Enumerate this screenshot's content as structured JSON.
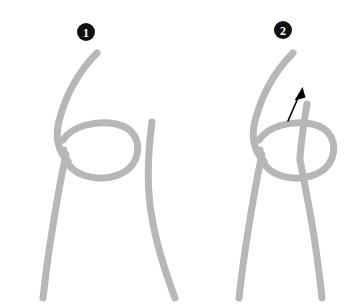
{
  "canvas": {
    "width": 353,
    "height": 305,
    "background_color": "#ffffff"
  },
  "style": {
    "rope_color": "#b7b7b7",
    "rope_width": 7,
    "badge_fill": "#111111",
    "badge_text_color": "#ffffff",
    "badge_radius": 9,
    "arrow_color": "#000000",
    "arrow_width": 1.6
  },
  "diagram": {
    "type": "two-step-knot-sequence"
  },
  "panels": [
    {
      "id": "panel-1",
      "badge": {
        "label": "1",
        "glyph": "❶",
        "cx": 86,
        "cy": 32
      },
      "description": "Rope forms an overhand loop beside a separate standing strand",
      "strands": [
        {
          "name": "working-strand-with-loop",
          "path": "M 97 53 C 78 72 64 96 57 124 C 51 147 62 166 83 172 C 107 178 130 166 131 148 C 132 131 113 122 95 128 C 74 135 63 158 58 182 C 52 212 47 255 43 298"
        },
        {
          "name": "standing-strand",
          "path": "M 152 122 C 148 152 146 186 152 218 C 157 248 166 274 175 298"
        }
      ],
      "arrow": null
    },
    {
      "id": "panel-2",
      "badge": {
        "label": "2",
        "glyph": "❷",
        "cx": 283,
        "cy": 30
      },
      "description": "End of standing strand tucked up through the loop, arrow shows pull direction",
      "strands": [
        {
          "name": "working-strand-with-loop",
          "path": "M 293 53 C 274 72 260 96 253 124 C 247 147 258 166 279 172 C 303 178 326 166 327 148 C 328 131 309 122 291 128 C 270 135 259 158 254 182 C 248 212 243 255 239 298"
        },
        {
          "name": "tucked-end-strand",
          "path": "M 307 104 C 303 130 299 152 303 168 C 308 190 315 222 319 250 C 322 272 324 288 325 298"
        }
      ],
      "arrow": {
        "name": "pull-direction-arrow",
        "path": "M 288 121 C 292 112 296 102 300 94",
        "tip": {
          "x": 302,
          "y": 89
        },
        "head_points": "302,88 296,100 305,97"
      }
    }
  ]
}
